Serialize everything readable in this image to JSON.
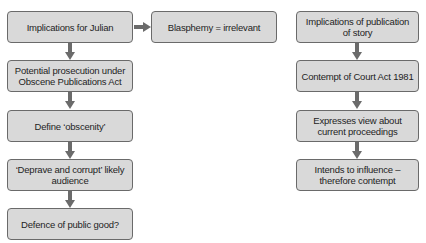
{
  "diagram": {
    "left_column": {
      "nodes": [
        {
          "id": "julian",
          "label": "Implications for Julian"
        },
        {
          "id": "prosecution",
          "label": "Potential prosecution under Obscene Publications Act"
        },
        {
          "id": "obscenity",
          "label": "Define ‘obscenity’"
        },
        {
          "id": "deprave",
          "label": "‘Deprave and corrupt’ likely audience"
        },
        {
          "id": "defence",
          "label": "Defence of public good?"
        }
      ]
    },
    "side_node": {
      "id": "blasphemy",
      "label": "Blasphemy = irrelevant"
    },
    "right_column": {
      "nodes": [
        {
          "id": "publication",
          "label": "Implications of publication of story"
        },
        {
          "id": "contempt-act",
          "label": "Contempt of Court Act 1981"
        },
        {
          "id": "view",
          "label": "Expresses view about current proceedings"
        },
        {
          "id": "influence",
          "label": "Intends to influence – therefore contempt"
        }
      ]
    },
    "edges": [
      {
        "from": "julian",
        "to": "blasphemy",
        "direction": "right"
      },
      {
        "from": "julian",
        "to": "prosecution",
        "direction": "down"
      },
      {
        "from": "prosecution",
        "to": "obscenity",
        "direction": "down"
      },
      {
        "from": "obscenity",
        "to": "deprave",
        "direction": "down"
      },
      {
        "from": "deprave",
        "to": "defence",
        "direction": "down"
      },
      {
        "from": "publication",
        "to": "contempt-act",
        "direction": "down"
      },
      {
        "from": "contempt-act",
        "to": "view",
        "direction": "down"
      },
      {
        "from": "view",
        "to": "influence",
        "direction": "down"
      }
    ],
    "colors": {
      "box_fill": "#d9d9d9",
      "box_border": "#6a6a6a",
      "arrow": "#6b6b6b",
      "text": "#1e1e1e"
    }
  }
}
